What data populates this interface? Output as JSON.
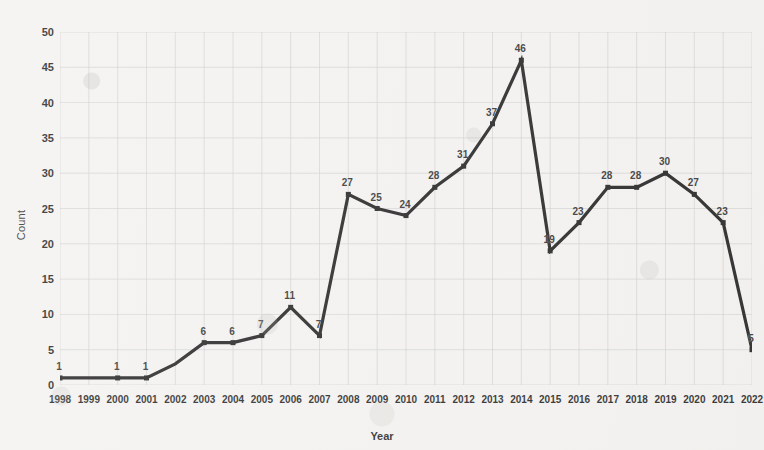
{
  "chart_data": {
    "type": "line",
    "title": "",
    "xlabel": "Year",
    "ylabel": "Count",
    "categories": [
      "1998",
      "1999",
      "2000",
      "2001",
      "2002",
      "2003",
      "2004",
      "2005",
      "2006",
      "2007",
      "2008",
      "2009",
      "2010",
      "2011",
      "2012",
      "2013",
      "2014",
      "2015",
      "2016",
      "2017",
      "2018",
      "2019",
      "2020",
      "2021",
      "2022"
    ],
    "values": [
      1,
      1,
      1,
      1,
      3,
      6,
      6,
      7,
      11,
      7,
      27,
      25,
      24,
      28,
      31,
      37,
      46,
      19,
      23,
      28,
      28,
      30,
      27,
      23,
      5
    ],
    "point_labels": [
      "1",
      "",
      "1",
      "1",
      "",
      "6",
      "6",
      "7",
      "11",
      "7",
      "27",
      "25",
      "24",
      "28",
      "31",
      "37",
      "46",
      "19",
      "23",
      "28",
      "28",
      "30",
      "27",
      "23",
      "5"
    ],
    "ylim": [
      0,
      50
    ],
    "yticks": [
      0,
      5,
      10,
      15,
      20,
      25,
      30,
      35,
      40,
      45,
      50
    ],
    "grid": true,
    "legend": "none",
    "series_color": "#1a1a1a",
    "grid_color": "#c9c9c9",
    "background_color": "#f3f2f0",
    "marker": "square"
  }
}
